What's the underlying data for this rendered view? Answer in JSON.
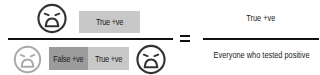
{
  "numerator": {
    "face_icon": "tired-face-icon",
    "box_label": "True +ve",
    "box_color": "#c8c8c8"
  },
  "denominator": {
    "left_face_icon": "tired-face-icon",
    "left_face_color": "#aaaaaa",
    "false_box_label": "False +ve",
    "false_box_color": "#9b9b9b",
    "true_box_label": "True +ve",
    "true_box_color": "#c8c8c8",
    "right_face_icon": "tired-face-icon",
    "right_face_color": "#333333"
  },
  "operator": "=",
  "result": {
    "numerator": "True +ve",
    "denominator": "Everyone who tested positive"
  },
  "colors": {
    "face_dark": "#333333",
    "line": "#111111"
  }
}
